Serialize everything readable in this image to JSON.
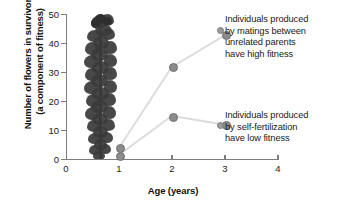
{
  "chart_data": {
    "type": "line",
    "title": "",
    "xlabel": "Age (years)",
    "ylabel_line1": "Number of flowers in survivors",
    "ylabel_line2": "(a component of fitness)",
    "xlim": [
      0,
      4
    ],
    "ylim": [
      0,
      50
    ],
    "xticks": [
      "0",
      "1",
      "2",
      "3",
      "4"
    ],
    "yticks": [
      "0",
      "10",
      "20",
      "30",
      "40",
      "50"
    ],
    "grid": false,
    "legend": "annotations",
    "x": [
      1,
      2,
      3
    ],
    "series": [
      {
        "name": "outcrossed",
        "values": [
          4,
          32,
          43
        ],
        "annotation_line1": "Individuals produced",
        "annotation_line2": "by matings between",
        "annotation_line3": "unrelated parents",
        "annotation_line4": "have high fitness"
      },
      {
        "name": "self-fertilized",
        "values": [
          1.5,
          15,
          12
        ],
        "annotation_line1": "Individuals produced",
        "annotation_line2": "by self-fertilization",
        "annotation_line3": "have low fitness"
      }
    ],
    "colors": {
      "line": "#dcdcdc",
      "point": "#8c8c8c",
      "axis": "#7d7d7d",
      "text": "#1a1a1a"
    }
  },
  "figure": {
    "plant_photo_alt": "flowering-plant-photo"
  }
}
